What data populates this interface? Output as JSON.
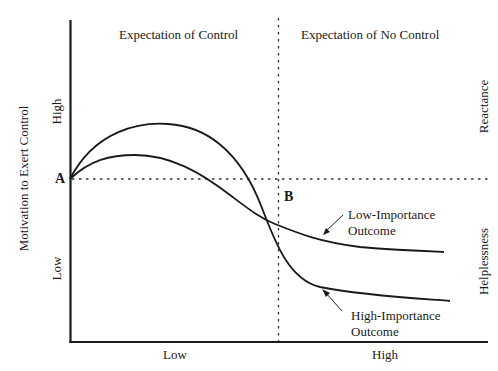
{
  "diagram": {
    "y_axis": {
      "title": "Motivation to Exert Control",
      "tick_high": "High",
      "tick_low": "Low"
    },
    "x_axis": {
      "tick_low": "Low",
      "tick_high": "High"
    },
    "regions": {
      "left": "Expectation of Control",
      "right": "Expectation of No Control"
    },
    "side_labels": {
      "top": "Reactance",
      "bottom": "Helplessness"
    },
    "points": {
      "a": "A",
      "b": "B"
    },
    "curves": {
      "low_importance": {
        "label_line1": "Low-Importance",
        "label_line2": "Outcome"
      },
      "high_importance": {
        "label_line1": "High-Importance",
        "label_line2": "Outcome"
      }
    },
    "colors": {
      "ink": "#1a1a1a",
      "background": "#ffffff"
    }
  }
}
